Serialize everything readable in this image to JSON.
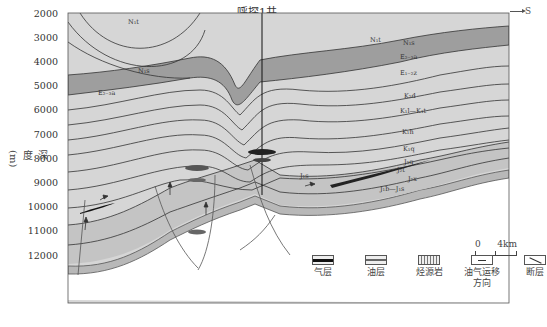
{
  "diagram": {
    "title": "呼探1井",
    "direction_label": "S",
    "y_axis": {
      "label": "深度(m)",
      "ticks": [
        "2000",
        "3000",
        "4000",
        "5000",
        "6000",
        "7000",
        "8000",
        "9000",
        "10000",
        "11000",
        "12000"
      ]
    },
    "formation_labels": {
      "left": [
        "N1t",
        "N1s",
        "E2-3a"
      ],
      "right": [
        "N1t",
        "N1s",
        "E2-3a",
        "E1-2z",
        "K2d",
        "K1l—K1t",
        "K1h",
        "K1q",
        "J3q",
        "J2t",
        "J2x",
        "J1b—J1s",
        "J1s"
      ]
    },
    "scale_bar": {
      "start": "0",
      "end": "4km"
    },
    "legend": [
      {
        "key": "gas",
        "label": "气层"
      },
      {
        "key": "oil",
        "label": "油层"
      },
      {
        "key": "source",
        "label": "烃源岩"
      },
      {
        "key": "migration",
        "label": "油气运移方向"
      },
      {
        "key": "fault",
        "label": "断层"
      }
    ],
    "colors": {
      "light_layer": "#d9d9d9",
      "mid_layer": "#c4c4c4",
      "dark_layer": "#9a9a9a",
      "gas": "#222222",
      "oil": "#555555",
      "line": "#333333"
    }
  }
}
